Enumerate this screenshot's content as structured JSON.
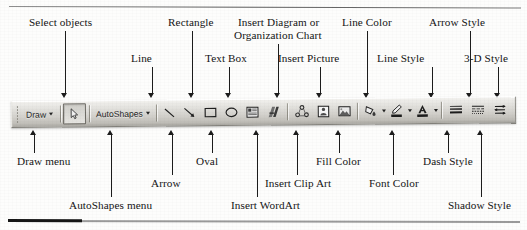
{
  "toolbar": {
    "name": "Drawing toolbar",
    "draw_menu_label": "Draw",
    "autoshapes_menu_label": "AutoShapes",
    "overflow_label": "»",
    "buttons": [
      {
        "name": "select-objects",
        "label": "Select objects"
      },
      {
        "name": "line",
        "label": "Line"
      },
      {
        "name": "arrow",
        "label": "Arrow"
      },
      {
        "name": "rectangle",
        "label": "Rectangle"
      },
      {
        "name": "oval",
        "label": "Oval"
      },
      {
        "name": "text-box",
        "label": "Text Box"
      },
      {
        "name": "insert-wordart",
        "label": "Insert WordArt"
      },
      {
        "name": "insert-diagram",
        "label": "Insert Diagram or Organization Chart"
      },
      {
        "name": "insert-clip-art",
        "label": "Insert Clip Art"
      },
      {
        "name": "insert-picture",
        "label": "Insert Picture"
      },
      {
        "name": "fill-color",
        "label": "Fill Color"
      },
      {
        "name": "line-color",
        "label": "Line Color"
      },
      {
        "name": "font-color",
        "label": "Font Color"
      },
      {
        "name": "line-style",
        "label": "Line Style"
      },
      {
        "name": "dash-style",
        "label": "Dash Style"
      },
      {
        "name": "arrow-style",
        "label": "Arrow Style"
      },
      {
        "name": "shadow-style",
        "label": "Shadow Style"
      },
      {
        "name": "3d-style",
        "label": "3-D Style"
      }
    ]
  },
  "callouts": {
    "above": [
      {
        "key": "select-objects",
        "text": "Select objects"
      },
      {
        "key": "line",
        "text": "Line"
      },
      {
        "key": "rectangle",
        "text": "Rectangle"
      },
      {
        "key": "text-box",
        "text": "Text Box"
      },
      {
        "key": "insert-diagram-1",
        "text": "Insert Diagram or"
      },
      {
        "key": "insert-diagram-2",
        "text": "Organization Chart"
      },
      {
        "key": "insert-picture",
        "text": "Insert Picture"
      },
      {
        "key": "line-color",
        "text": "Line Color"
      },
      {
        "key": "line-style",
        "text": "Line Style"
      },
      {
        "key": "arrow-style",
        "text": "Arrow Style"
      },
      {
        "key": "3d-style",
        "text": "3-D Style"
      }
    ],
    "below": [
      {
        "key": "draw-menu",
        "text": "Draw menu"
      },
      {
        "key": "autoshapes-menu",
        "text": "AutoShapes menu"
      },
      {
        "key": "arrow",
        "text": "Arrow"
      },
      {
        "key": "oval",
        "text": "Oval"
      },
      {
        "key": "insert-wordart",
        "text": "Insert WordArt"
      },
      {
        "key": "insert-clip-art",
        "text": "Insert Clip Art"
      },
      {
        "key": "fill-color",
        "text": "Fill Color"
      },
      {
        "key": "font-color",
        "text": "Font Color"
      },
      {
        "key": "dash-style",
        "text": "Dash Style"
      },
      {
        "key": "shadow-style",
        "text": "Shadow Style"
      }
    ]
  },
  "colors": {
    "ink": "#141414",
    "rule": "#9a9a9a",
    "rule_dark": "#161616",
    "toolbar_face": "#d9d8d3"
  }
}
